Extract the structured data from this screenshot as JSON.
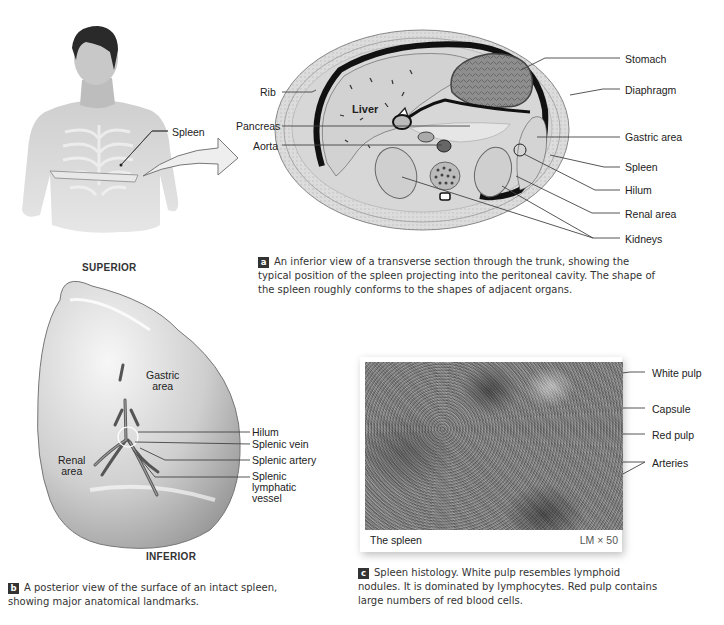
{
  "figure": {
    "torso_photo": {
      "labels": {
        "spleen": "Spleen"
      }
    },
    "panel_a": {
      "key": "a",
      "labels_left": {
        "rib": "Rib",
        "pancreas": "Pancreas",
        "aorta": "Aorta"
      },
      "label_inner": {
        "liver": "Liver"
      },
      "labels_right": {
        "stomach": "Stomach",
        "diaphragm": "Diaphragm",
        "gastric_area": "Gastric area",
        "spleen": "Spleen",
        "hilum": "Hilum",
        "renal_area": "Renal area",
        "kidneys": "Kidneys"
      },
      "caption": "An inferior view of a transverse section through the trunk, showing the typical position of the spleen projecting into the peritoneal cavity. The shape of the spleen roughly conforms to the shapes of adjacent organs."
    },
    "panel_b": {
      "key": "b",
      "orientation_top": "SUPERIOR",
      "orientation_bottom": "INFERIOR",
      "labels_inner": {
        "gastric_area_1": "Gastric",
        "gastric_area_2": "area",
        "renal_area_1": "Renal",
        "renal_area_2": "area"
      },
      "labels_right": {
        "hilum": "Hilum",
        "splenic_vein": "Splenic vein",
        "splenic_artery": "Splenic artery",
        "lymph_1": "Splenic",
        "lymph_2": "lymphatic",
        "lymph_3": "vessel"
      },
      "caption": "A posterior view of the surface of an intact spleen, showing major anatomical landmarks."
    },
    "panel_c": {
      "key": "c",
      "image_title": "The spleen",
      "magnification": "LM × 50",
      "labels_right": {
        "white_pulp": "White pulp",
        "capsule": "Capsule",
        "red_pulp": "Red pulp",
        "arteries": "Arteries"
      },
      "caption": "Spleen histology. White pulp resembles lymphoid nodules. It is dominated by lymphocytes. Red pulp contains large numbers of red blood cells."
    }
  }
}
